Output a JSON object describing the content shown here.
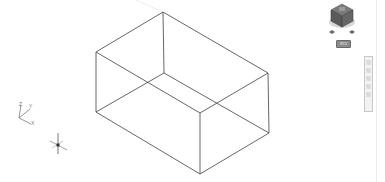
{
  "app": {
    "type": "cad-3d-viewport",
    "background_color": "#ffffff",
    "line_color": "#555555"
  },
  "viewport": {
    "model": {
      "name": "box",
      "render_style": "wireframe",
      "vertices": {
        "top_back": [
          163,
          12
        ],
        "top_left": [
          96,
          52
        ],
        "top_right": [
          268,
          73
        ],
        "top_front": [
          200,
          113
        ],
        "bottom_back": [
          164,
          73
        ],
        "bottom_left": [
          96,
          112
        ],
        "bottom_right": [
          269,
          133
        ],
        "bottom_front": [
          200,
          174
        ]
      }
    },
    "ucs_icon": {
      "labels": {
        "z": "Z",
        "y": "Y",
        "x": "X"
      },
      "origin": [
        19,
        118
      ]
    },
    "crosshair_cursor": {
      "center": [
        58,
        145
      ]
    }
  },
  "viewcube": {
    "icon": "viewcube-icon",
    "coordinate_system_label": "WCS"
  },
  "navigation_bar": {
    "icon": "navigation-bar-icon",
    "buttons": [
      "full-navigation-wheel",
      "pan",
      "zoom",
      "orbit",
      "showmotion"
    ]
  }
}
